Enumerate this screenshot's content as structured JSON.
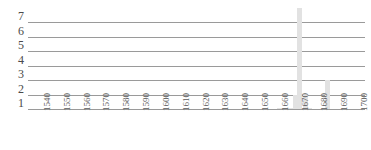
{
  "chart_data": {
    "type": "bar",
    "title": "",
    "subtitle": "",
    "xlabel": "",
    "ylabel": "",
    "xlim": [
      1535,
      1705
    ],
    "ylim": [
      1,
      8
    ],
    "grid": true,
    "legend": null,
    "y_ticks": [
      7,
      6,
      5,
      4,
      3,
      2,
      1
    ],
    "x_ticks": [
      1540,
      1550,
      1560,
      1570,
      1580,
      1590,
      1600,
      1610,
      1620,
      1630,
      1640,
      1650,
      1660,
      1670,
      1680,
      1690,
      1700
    ],
    "x_tick_labels": [
      "1540",
      "1550",
      "1560",
      "1570",
      "1580",
      "1590",
      "1600",
      "1610",
      "1620",
      "1630",
      "1640",
      "1650",
      "1660",
      "1670",
      "1680",
      "1690",
      "1700"
    ],
    "bar_color": "#e2e2e2",
    "grid_color": "#9a9a9a",
    "categories": [
      1662,
      1664,
      1666,
      1668,
      1670,
      1672,
      1675,
      1677,
      1686
    ],
    "values": [
      1,
      1,
      1,
      1,
      2,
      8,
      2,
      1,
      3
    ],
    "bars": [
      {
        "x": 1662,
        "value": 1
      },
      {
        "x": 1664,
        "value": 1
      },
      {
        "x": 1666,
        "value": 1
      },
      {
        "x": 1668,
        "value": 1
      },
      {
        "x": 1670,
        "value": 2
      },
      {
        "x": 1672,
        "value": 8
      },
      {
        "x": 1675,
        "value": 2
      },
      {
        "x": 1677,
        "value": 1
      },
      {
        "x": 1686,
        "value": 3
      }
    ]
  }
}
